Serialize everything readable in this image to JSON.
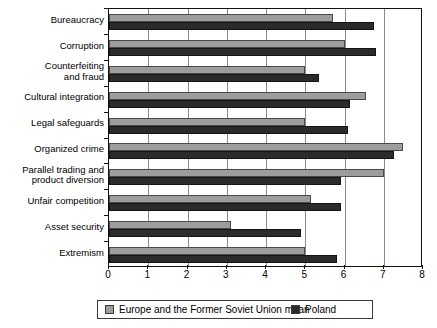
{
  "chart_data": {
    "type": "bar",
    "orientation": "horizontal",
    "title": "",
    "subtitle": "",
    "xlabel": "",
    "ylabel": "",
    "xlim": [
      0,
      8
    ],
    "xticks": [
      0,
      1,
      2,
      3,
      4,
      5,
      6,
      7,
      8
    ],
    "xtick_labels": [
      "0",
      "1",
      "2",
      "3",
      "4",
      "5",
      "6",
      "7",
      "8"
    ],
    "grid": true,
    "grid_axis": "x",
    "legend_position": "bottom",
    "categories": [
      "Bureaucracy",
      "Corruption",
      "Counterfeiting\nand fraud",
      "Cultural integration",
      "Legal safeguards",
      "Organized crime",
      "Parallel trading and\nproduct diversion",
      "Unfair competition",
      "Asset security",
      "Extremism"
    ],
    "series": [
      {
        "name": "Europe and the Former Soviet Union mean",
        "color": "#9d9d9d",
        "values": [
          5.7,
          6.0,
          5.0,
          6.55,
          5.0,
          7.5,
          7.0,
          5.15,
          3.1,
          5.0
        ]
      },
      {
        "name": "Poland",
        "color": "#2b2b2b",
        "values": [
          6.75,
          6.8,
          5.35,
          6.15,
          6.1,
          7.25,
          5.9,
          5.9,
          4.9,
          5.8
        ]
      }
    ]
  },
  "legend": {
    "items": [
      {
        "label": "Europe and the Former Soviet Union mean",
        "color": "#9d9d9d"
      },
      {
        "label": "Poland",
        "color": "#2b2b2b"
      }
    ]
  }
}
